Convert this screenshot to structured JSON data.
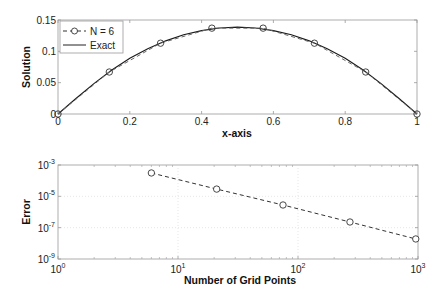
{
  "chart_data": [
    {
      "type": "line",
      "title": "",
      "xlabel": "x-axis",
      "ylabel": "Solution",
      "xlim": [
        0,
        1
      ],
      "ylim": [
        0,
        0.15
      ],
      "xticks": [
        0,
        0.2,
        0.4,
        0.6,
        0.8,
        1
      ],
      "xtick_labels": [
        "0",
        "0.2",
        "0.4",
        "0.6",
        "0.8",
        "1"
      ],
      "yticks": [
        0,
        0.05,
        0.1,
        0.15
      ],
      "ytick_labels": [
        "0",
        "0.05",
        "0.1",
        "0.15"
      ],
      "grid": false,
      "legend_position": "upper left",
      "series": [
        {
          "name": "N = 6",
          "style": "dashed-circle-markers",
          "x": [
            0,
            0.1429,
            0.2857,
            0.4286,
            0.5714,
            0.7143,
            0.8571,
            1
          ],
          "y": [
            0,
            0.067,
            0.113,
            0.137,
            0.137,
            0.113,
            0.067,
            0
          ]
        },
        {
          "name": "Exact",
          "style": "solid",
          "x": [
            0,
            0.05,
            0.1,
            0.15,
            0.2,
            0.25,
            0.3,
            0.35,
            0.4,
            0.45,
            0.5,
            0.55,
            0.6,
            0.65,
            0.7,
            0.75,
            0.8,
            0.85,
            0.9,
            0.95,
            1
          ],
          "y": [
            0,
            0.0247,
            0.0484,
            0.0701,
            0.0889,
            0.1042,
            0.1167,
            0.1264,
            0.1331,
            0.1372,
            0.1386,
            0.1372,
            0.1331,
            0.1264,
            0.1167,
            0.1042,
            0.0889,
            0.0701,
            0.0484,
            0.0247,
            0
          ]
        }
      ]
    },
    {
      "type": "line",
      "title": "",
      "xlabel": "Number of Grid Points",
      "ylabel": "Error",
      "xscale": "log",
      "yscale": "log",
      "xlim": [
        1,
        1000
      ],
      "ylim": [
        1e-09,
        0.001
      ],
      "xtick_labels": [
        "10^0",
        "10^1",
        "10^2",
        "10^3"
      ],
      "ytick_labels": [
        "10^-9",
        "10^-7",
        "10^-5",
        "10^-3"
      ],
      "grid": true,
      "series": [
        {
          "name": "Error",
          "style": "dashed-circle-markers",
          "x": [
            6,
            21,
            75,
            271,
            958
          ],
          "y": [
            0.00031,
            2.9e-05,
            2.8e-06,
            2.3e-07,
            1.9e-08
          ]
        }
      ]
    }
  ],
  "labels": {
    "top_xlabel": "x-axis",
    "top_ylabel": "Solution",
    "bottom_xlabel": "Number of Grid Points",
    "bottom_ylabel": "Error",
    "legend_numeric": "N = 6",
    "legend_exact": "Exact"
  }
}
